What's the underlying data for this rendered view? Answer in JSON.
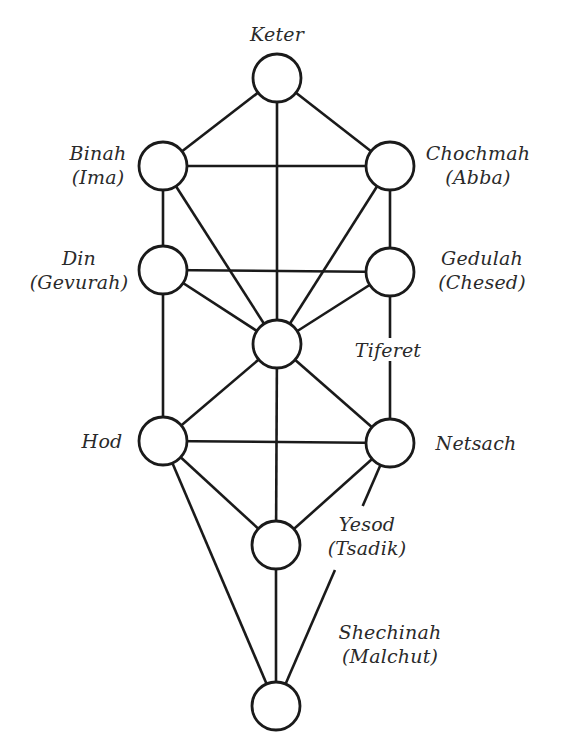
{
  "diagram": {
    "nodes": [
      {
        "id": "keter",
        "name": "Keter",
        "alt": "",
        "cx": 277,
        "cy": 78
      },
      {
        "id": "binah",
        "name": "Binah",
        "alt": "(Ima)",
        "cx": 163,
        "cy": 166
      },
      {
        "id": "chochmah",
        "name": "Chochmah",
        "alt": "(Abba)",
        "cx": 390,
        "cy": 166
      },
      {
        "id": "din",
        "name": "Din",
        "alt": "(Gevurah)",
        "cx": 163,
        "cy": 270
      },
      {
        "id": "gedulah",
        "name": "Gedulah",
        "alt": "(Chesed)",
        "cx": 390,
        "cy": 272
      },
      {
        "id": "tiferet",
        "name": "Tiferet",
        "alt": "",
        "cx": 277,
        "cy": 344
      },
      {
        "id": "hod",
        "name": "Hod",
        "alt": "",
        "cx": 163,
        "cy": 441
      },
      {
        "id": "netsach",
        "name": "Netsach",
        "alt": "",
        "cx": 390,
        "cy": 443
      },
      {
        "id": "yesod",
        "name": "Yesod",
        "alt": "(Tsadik)",
        "cx": 276,
        "cy": 545
      },
      {
        "id": "shechinah",
        "name": "Shechinah",
        "alt": "(Malchut)",
        "cx": 276,
        "cy": 706
      }
    ],
    "node_radius": 24,
    "edges": [
      [
        "keter",
        "binah"
      ],
      [
        "keter",
        "chochmah"
      ],
      [
        "keter",
        "tiferet"
      ],
      [
        "binah",
        "chochmah"
      ],
      [
        "binah",
        "din"
      ],
      [
        "binah",
        "tiferet"
      ],
      [
        "chochmah",
        "gedulah"
      ],
      [
        "chochmah",
        "tiferet"
      ],
      [
        "din",
        "gedulah"
      ],
      [
        "din",
        "tiferet"
      ],
      [
        "din",
        "hod"
      ],
      [
        "gedulah",
        "tiferet"
      ],
      [
        "gedulah",
        "netsach"
      ],
      [
        "tiferet",
        "hod"
      ],
      [
        "tiferet",
        "netsach"
      ],
      [
        "tiferet",
        "yesod"
      ],
      [
        "hod",
        "netsach"
      ],
      [
        "hod",
        "yesod"
      ],
      [
        "hod",
        "shechinah"
      ],
      [
        "netsach",
        "yesod"
      ],
      [
        "netsach",
        "shechinah"
      ],
      [
        "yesod",
        "shechinah"
      ]
    ],
    "edge_gaps": [
      {
        "edge": [
          "gedulah",
          "netsach"
        ],
        "from_y": 338,
        "to_y": 361
      },
      {
        "edge": [
          "netsach",
          "shechinah"
        ],
        "from_y": 506,
        "to_y": 570
      }
    ],
    "labels": {
      "keter": {
        "line1": "Keter",
        "line2": "",
        "x": 277,
        "y": 22,
        "align": "center"
      },
      "binah": {
        "line1": "Binah",
        "line2": "(Ima)",
        "x": 98,
        "y": 141,
        "align": "center"
      },
      "chochmah": {
        "line1": "Chochmah",
        "line2": "(Abba)",
        "x": 478,
        "y": 141,
        "align": "center"
      },
      "din": {
        "line1": "Din",
        "line2": "(Gevurah)",
        "x": 79,
        "y": 246,
        "align": "center"
      },
      "gedulah": {
        "line1": "Gedulah",
        "line2": "(Chesed)",
        "x": 482,
        "y": 246,
        "align": "center"
      },
      "tiferet": {
        "line1": "Tiferet",
        "line2": "",
        "x": 388,
        "y": 338,
        "align": "center"
      },
      "hod": {
        "line1": "Hod",
        "line2": "",
        "x": 102,
        "y": 429,
        "align": "center"
      },
      "netsach": {
        "line1": "Netsach",
        "line2": "",
        "x": 476,
        "y": 431,
        "align": "center"
      },
      "yesod": {
        "line1": "Yesod",
        "line2": "(Tsadik)",
        "x": 367,
        "y": 512,
        "align": "center"
      },
      "shechinah": {
        "line1": "Shechinah",
        "line2": "(Malchut)",
        "x": 390,
        "y": 620,
        "align": "center"
      }
    }
  }
}
